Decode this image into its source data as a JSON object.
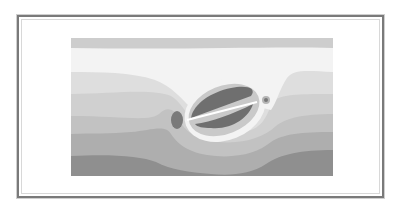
{
  "figure": {
    "colors": {
      "band_top": "#cdcdcd",
      "band_white": "#f3f3f3",
      "band_light": "#dedede",
      "band_mid_light": "#d0d0d0",
      "band_mid": "#c2c2c2",
      "band_mid_dark": "#aeaeae",
      "band_dark": "#8f8f8f",
      "lobe_dark": "#6f6f6f",
      "crack": "#ffffff",
      "frame": "#7a7a7a"
    }
  }
}
